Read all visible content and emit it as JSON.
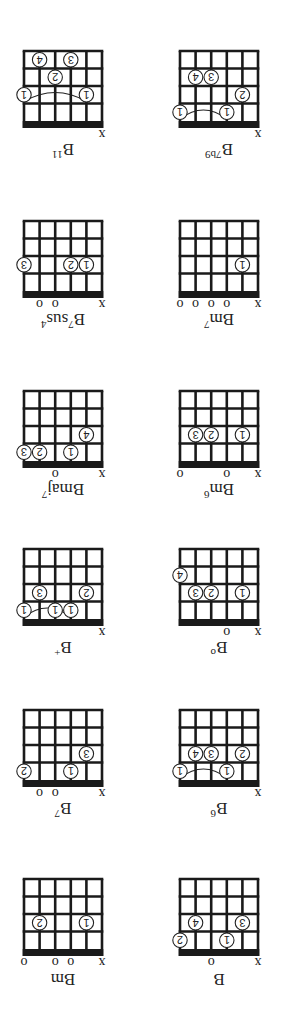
{
  "orientation": "rotated 180 degrees",
  "strings": 6,
  "frets_shown": 4,
  "colors": {
    "lines": "#1a1a1a",
    "nut": "#1a1a1a",
    "background": "#ffffff"
  },
  "chords": [
    {
      "name": "B",
      "base": "B",
      "sup": "",
      "col": 0,
      "row": 0,
      "markers": [
        "x",
        "",
        "",
        "o",
        "",
        ""
      ],
      "fingers": [
        {
          "s": 1,
          "f": 2,
          "n": "3"
        },
        {
          "s": 2,
          "f": 1,
          "n": "1"
        },
        {
          "s": 4,
          "f": 2,
          "n": "4"
        },
        {
          "s": 5,
          "f": 1,
          "n": "2"
        }
      ],
      "barre": null
    },
    {
      "name": "Bm",
      "base": "Bm",
      "sup": "",
      "col": 1,
      "row": 0,
      "markers": [
        "x",
        "",
        "o",
        "o",
        "",
        "o"
      ],
      "fingers": [
        {
          "s": 1,
          "f": 2,
          "n": "1"
        },
        {
          "s": 4,
          "f": 2,
          "n": "2"
        }
      ],
      "barre": null
    },
    {
      "name": "B6",
      "base": "B",
      "sup": "6",
      "col": 0,
      "row": 1,
      "markers": [
        "x",
        "",
        "",
        "",
        "",
        ""
      ],
      "fingers": [
        {
          "s": 1,
          "f": 2,
          "n": "2"
        },
        {
          "s": 2,
          "f": 1,
          "n": "1"
        },
        {
          "s": 3,
          "f": 2,
          "n": "3"
        },
        {
          "s": 4,
          "f": 2,
          "n": "4"
        },
        {
          "s": 5,
          "f": 1,
          "n": "1"
        }
      ],
      "barre": {
        "from": 2,
        "to": 5,
        "f": 1
      }
    },
    {
      "name": "B7",
      "base": "B",
      "sup": "7",
      "col": 1,
      "row": 1,
      "markers": [
        "x",
        "",
        "",
        "o",
        "o",
        ""
      ],
      "fingers": [
        {
          "s": 1,
          "f": 2,
          "n": "3"
        },
        {
          "s": 2,
          "f": 1,
          "n": "1"
        },
        {
          "s": 5,
          "f": 1,
          "n": "2"
        }
      ],
      "barre": null
    },
    {
      "name": "B°",
      "base": "B",
      "sup": "o",
      "col": 0,
      "row": 2,
      "markers": [
        "x",
        "",
        "o",
        "",
        "",
        ""
      ],
      "fingers": [
        {
          "s": 1,
          "f": 2,
          "n": "1"
        },
        {
          "s": 3,
          "f": 2,
          "n": "2"
        },
        {
          "s": 4,
          "f": 2,
          "n": "3"
        },
        {
          "s": 5,
          "f": 3,
          "n": "4"
        }
      ],
      "barre": null
    },
    {
      "name": "B+",
      "base": "B",
      "sup": "+",
      "col": 1,
      "row": 2,
      "markers": [
        "x",
        "",
        "",
        "",
        "",
        ""
      ],
      "fingers": [
        {
          "s": 1,
          "f": 2,
          "n": "2"
        },
        {
          "s": 2,
          "f": 1,
          "n": "1"
        },
        {
          "s": 3,
          "f": 1,
          "n": "1"
        },
        {
          "s": 4,
          "f": 2,
          "n": "3"
        },
        {
          "s": 5,
          "f": 1,
          "n": "1"
        }
      ],
      "barre": {
        "from": 2,
        "to": 5,
        "f": 1
      }
    },
    {
      "name": "Bm6",
      "base": "Bm",
      "sup": "6",
      "col": 0,
      "row": 3,
      "markers": [
        "x",
        "",
        "o",
        "",
        "",
        "o"
      ],
      "fingers": [
        {
          "s": 1,
          "f": 2,
          "n": "1"
        },
        {
          "s": 3,
          "f": 2,
          "n": "2"
        },
        {
          "s": 4,
          "f": 2,
          "n": "3"
        }
      ],
      "barre": null
    },
    {
      "name": "Bmaj7",
      "base": "Bmaj",
      "sup": "7",
      "col": 1,
      "row": 3,
      "markers": [
        "x",
        "",
        "",
        "o",
        "",
        ""
      ],
      "fingers": [
        {
          "s": 1,
          "f": 2,
          "n": "4"
        },
        {
          "s": 2,
          "f": 1,
          "n": "1"
        },
        {
          "s": 4,
          "f": 1,
          "n": "2"
        },
        {
          "s": 5,
          "f": 1,
          "n": "3"
        }
      ],
      "barre": null
    },
    {
      "name": "Bm7",
      "base": "Bm",
      "sup": "7",
      "col": 0,
      "row": 4,
      "markers": [
        "x",
        "",
        "o",
        "o",
        "o",
        "o"
      ],
      "fingers": [
        {
          "s": 1,
          "f": 2,
          "n": "1"
        }
      ],
      "barre": null
    },
    {
      "name": "B7sus4",
      "base": "B",
      "sup": "7",
      "sub": "sus",
      "sup2": "4",
      "col": 1,
      "row": 4,
      "markers": [
        "x",
        "",
        "",
        "o",
        "o",
        ""
      ],
      "fingers": [
        {
          "s": 1,
          "f": 2,
          "n": "1"
        },
        {
          "s": 2,
          "f": 2,
          "n": "2"
        },
        {
          "s": 5,
          "f": 2,
          "n": "3"
        }
      ],
      "barre": null
    },
    {
      "name": "B7b9",
      "base": "B",
      "sup": "7b9",
      "col": 0,
      "row": 5,
      "markers": [
        "x",
        "",
        "",
        "",
        "",
        ""
      ],
      "fingers": [
        {
          "s": 1,
          "f": 2,
          "n": "2"
        },
        {
          "s": 2,
          "f": 1,
          "n": "1"
        },
        {
          "s": 3,
          "f": 3,
          "n": "3"
        },
        {
          "s": 4,
          "f": 3,
          "n": "4"
        },
        {
          "s": 5,
          "f": 1,
          "n": "1"
        }
      ],
      "barre": {
        "from": 2,
        "to": 5,
        "f": 1
      }
    },
    {
      "name": "B11",
      "base": "B",
      "sup": "11",
      "col": 1,
      "row": 5,
      "markers": [
        "x",
        "",
        "",
        "",
        "",
        ""
      ],
      "fingers": [
        {
          "s": 1,
          "f": 2,
          "n": "1"
        },
        {
          "s": 2,
          "f": 4,
          "n": "3"
        },
        {
          "s": 3,
          "f": 3,
          "n": "2"
        },
        {
          "s": 4,
          "f": 4,
          "n": "4"
        },
        {
          "s": 5,
          "f": 2,
          "n": "1"
        }
      ],
      "barre": {
        "from": 1,
        "to": 5,
        "f": 2
      }
    }
  ]
}
